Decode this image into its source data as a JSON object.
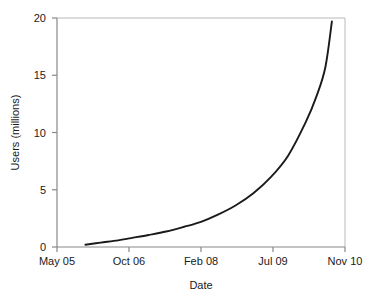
{
  "chart_data": {
    "type": "line",
    "title": "",
    "subtitle": "",
    "xlabel": "Date",
    "ylabel": "Users (millions)",
    "grid": false,
    "legend": false,
    "legend_position": "none",
    "xlim": [
      0,
      66
    ],
    "ylim": [
      0,
      20
    ],
    "x_unit": "months since May 2005",
    "xticks": [
      0,
      17,
      33,
      50,
      66
    ],
    "xticklabels": [
      "May 05",
      "Oct 06",
      "Feb 08",
      "Jul 09",
      "Nov 10"
    ],
    "yticks": [
      0,
      5,
      10,
      15,
      20
    ],
    "yticklabels": [
      "0",
      "5",
      "10",
      "15",
      "20"
    ],
    "series": [
      {
        "name": "Users",
        "color": "#1a1a1a",
        "x": [
          6.5,
          10,
          14,
          17,
          21,
          25,
          29,
          33,
          37,
          41,
          45,
          49,
          53,
          57,
          59.5,
          61.5,
          63
        ],
        "values": [
          0.2,
          0.38,
          0.58,
          0.78,
          1.05,
          1.35,
          1.75,
          2.2,
          2.85,
          3.65,
          4.7,
          6.1,
          8.0,
          10.9,
          13.2,
          15.7,
          19.7
        ]
      }
    ],
    "annotations": []
  },
  "axes": {
    "y_title": "Users (millions)",
    "x_title": "Date",
    "y_tick_0": "0",
    "y_tick_1": "5",
    "y_tick_2": "10",
    "y_tick_3": "15",
    "y_tick_4": "20",
    "x_tick_0": "May 05",
    "x_tick_1": "Oct 06",
    "x_tick_2": "Feb 08",
    "x_tick_3": "Jul 09",
    "x_tick_4": "Nov 10"
  },
  "colors": {
    "curve": "#1a1a1a",
    "axis": "#888888",
    "frame": "#b8b8b8",
    "text": "#1a1a1a",
    "background": "#ffffff"
  }
}
